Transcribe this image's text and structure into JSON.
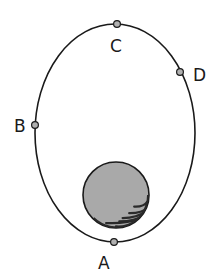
{
  "diagram": {
    "type": "elliptical-orbit",
    "orbit": {
      "cx": 115,
      "cy": 133,
      "rx": 80,
      "ry": 109,
      "stroke": "#1a1a1a"
    },
    "planet": {
      "cx": 116,
      "cy": 195,
      "r": 33,
      "fill": "#a9a9a9",
      "shade": "#2a2a2a"
    },
    "points": [
      {
        "label": "A",
        "x": 114,
        "y": 242,
        "label_x": 98,
        "label_y": 269
      },
      {
        "label": "B",
        "x": 35,
        "y": 125,
        "label_x": 14,
        "label_y": 132
      },
      {
        "label": "C",
        "x": 117,
        "y": 24,
        "label_x": 110,
        "label_y": 52
      },
      {
        "label": "D",
        "x": 180,
        "y": 72,
        "label_x": 193,
        "label_y": 81
      }
    ],
    "point_fill": "#b0b0b0"
  }
}
